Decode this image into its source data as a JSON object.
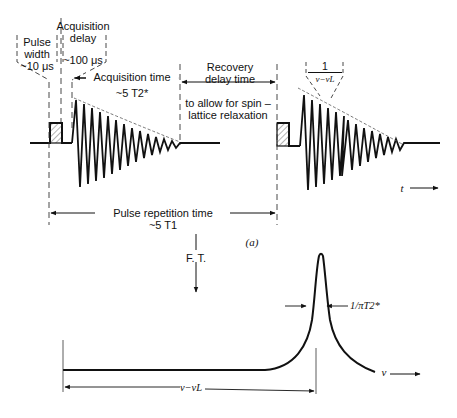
{
  "figure": {
    "part_a_label": "(a)",
    "top": {
      "pulse_width": {
        "line1": "Pulse",
        "line2": "width",
        "line3": "~10 μs"
      },
      "acquisition_delay": {
        "line1": "Acquisition",
        "line2": "delay",
        "line3": "~100 μs"
      },
      "acquisition_time": {
        "line1": "Acquisition time",
        "line2": "~5 T2*"
      },
      "recovery_delay": {
        "line1": "Recovery",
        "line2": "delay time"
      },
      "relaxation_note": {
        "line1": "to allow for spin –",
        "line2": "lattice relaxation"
      },
      "period_label": {
        "numerator": "1",
        "denominator": "ν−νL"
      },
      "time_axis": "t",
      "pulse_repetition": {
        "line1": "Pulse repetition time",
        "line2": "~5 T1"
      }
    },
    "transform_label": "F. T.",
    "bottom": {
      "linewidth_label": "1/πT2*",
      "offset_label": "ν−νL",
      "frequency_axis": "ν"
    }
  }
}
